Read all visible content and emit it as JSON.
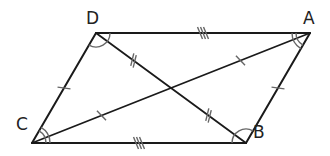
{
  "diagram": {
    "type": "parallelogram",
    "colors": {
      "stroke": "#1a1a1a",
      "mark": "#666666",
      "background": "#ffffff"
    },
    "vertices": [
      {
        "name": "D",
        "x": 96,
        "y": 33,
        "label_x": 86,
        "label_y": 10
      },
      {
        "name": "A",
        "x": 310,
        "y": 33,
        "label_x": 303,
        "label_y": 10
      },
      {
        "name": "B",
        "x": 246,
        "y": 143,
        "label_x": 253,
        "label_y": 124
      },
      {
        "name": "C",
        "x": 32,
        "y": 143,
        "label_x": 18,
        "label_y": 118
      }
    ],
    "sides": [
      {
        "from": "D",
        "to": "A",
        "ticks": 3
      },
      {
        "from": "A",
        "to": "B",
        "ticks": 1
      },
      {
        "from": "B",
        "to": "C",
        "ticks": 3
      },
      {
        "from": "C",
        "to": "D",
        "ticks": 1
      }
    ],
    "diagonals": [
      {
        "from": "D",
        "to": "B",
        "half_ticks": 2
      },
      {
        "from": "A",
        "to": "C",
        "half_ticks": 1
      }
    ],
    "angle_marks": [
      {
        "vertex": "D",
        "arcs": 1
      },
      {
        "vertex": "A",
        "arcs": 2
      },
      {
        "vertex": "B",
        "arcs": 1
      },
      {
        "vertex": "C",
        "arcs": 2
      }
    ],
    "labels": {
      "D": "D",
      "A": "A",
      "B": "B",
      "C": "C"
    }
  }
}
